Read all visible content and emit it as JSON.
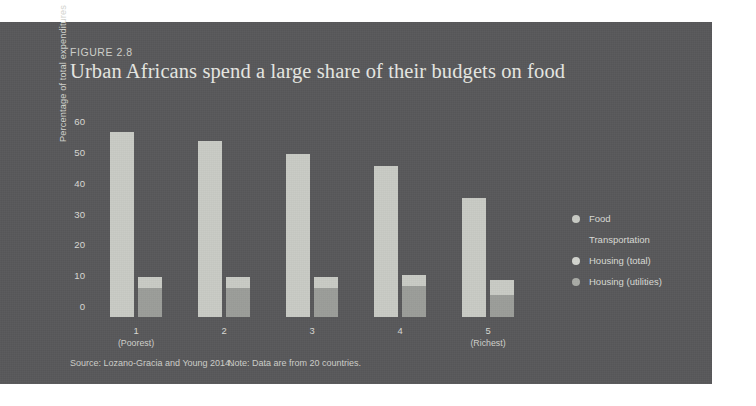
{
  "figure": {
    "number_label": "FIGURE 2.8",
    "title": "Urban Africans spend a large share of their budgets on food",
    "source": "Source: Lozano-Gracia and Young 2014.",
    "note": "Note: Data are from 20 countries."
  },
  "colors": {
    "panel_background": "#58585a",
    "page_background": "#ffffff",
    "food_bar": "#c8cac4",
    "housing_total_bar": "#c8cac4",
    "housing_utilities_bar": "#9b9d99",
    "text_primary": "#e6e7e2",
    "text_secondary": "#d8d9d4"
  },
  "legend": {
    "position": "right",
    "items": [
      {
        "label": "Food",
        "color": "#c8cac4",
        "has_marker": true
      },
      {
        "label": "Transportation",
        "color": "#58585a",
        "has_marker": false
      },
      {
        "label": "Housing (total)",
        "color": "#d2d4ce",
        "has_marker": true
      },
      {
        "label": "Housing (utilities)",
        "color": "#a9aba6",
        "has_marker": true
      }
    ]
  },
  "chart_data": {
    "type": "bar",
    "title": "Urban Africans spend a large share of their budgets on food",
    "xlabel": "",
    "ylabel": "Percentage of total expenditures",
    "ylim": [
      0,
      60
    ],
    "yticks": [
      0,
      10,
      20,
      30,
      40,
      50,
      60
    ],
    "grid": false,
    "categories": [
      "1",
      "2",
      "3",
      "4",
      "5"
    ],
    "category_sublabels": [
      "(Poorest)",
      "",
      "",
      "",
      "(Richest)"
    ],
    "series": [
      {
        "name": "Food",
        "values": [
          60,
          57,
          53,
          49,
          38.5
        ]
      },
      {
        "name": "Transportation",
        "values": [
          0,
          0,
          0,
          0,
          0
        ]
      },
      {
        "name": "Housing (total)",
        "values": [
          13,
          13,
          13,
          13.5,
          12
        ]
      },
      {
        "name": "Housing (utilities)",
        "values": [
          9.5,
          9.5,
          9.5,
          10,
          7
        ]
      }
    ]
  }
}
